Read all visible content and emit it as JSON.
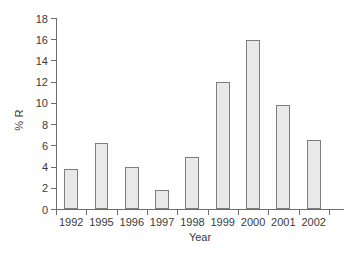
{
  "chart_data": {
    "type": "bar",
    "title": "",
    "xlabel": "Year",
    "ylabel": "% R",
    "categories": [
      "1992",
      "1995",
      "1996",
      "1997",
      "1998",
      "1999",
      "2000",
      "2001",
      "2002"
    ],
    "values": [
      3.8,
      6.2,
      4.0,
      1.8,
      4.9,
      12.0,
      15.9,
      9.8,
      6.5
    ],
    "ylim": [
      0,
      18
    ],
    "ytick_values": [
      0,
      2,
      4,
      6,
      8,
      10,
      12,
      14,
      16,
      18
    ],
    "ytick_labels": [
      "0",
      "2",
      "4",
      "6",
      "8",
      "10",
      "12",
      "14",
      "16",
      "18"
    ],
    "grid": false,
    "legend": null,
    "bar_fill_color": "#e9e9e9",
    "bar_border_color": "#7d7d7d",
    "axis_color": "#6e6e6e",
    "background_color": "#ffffff"
  }
}
